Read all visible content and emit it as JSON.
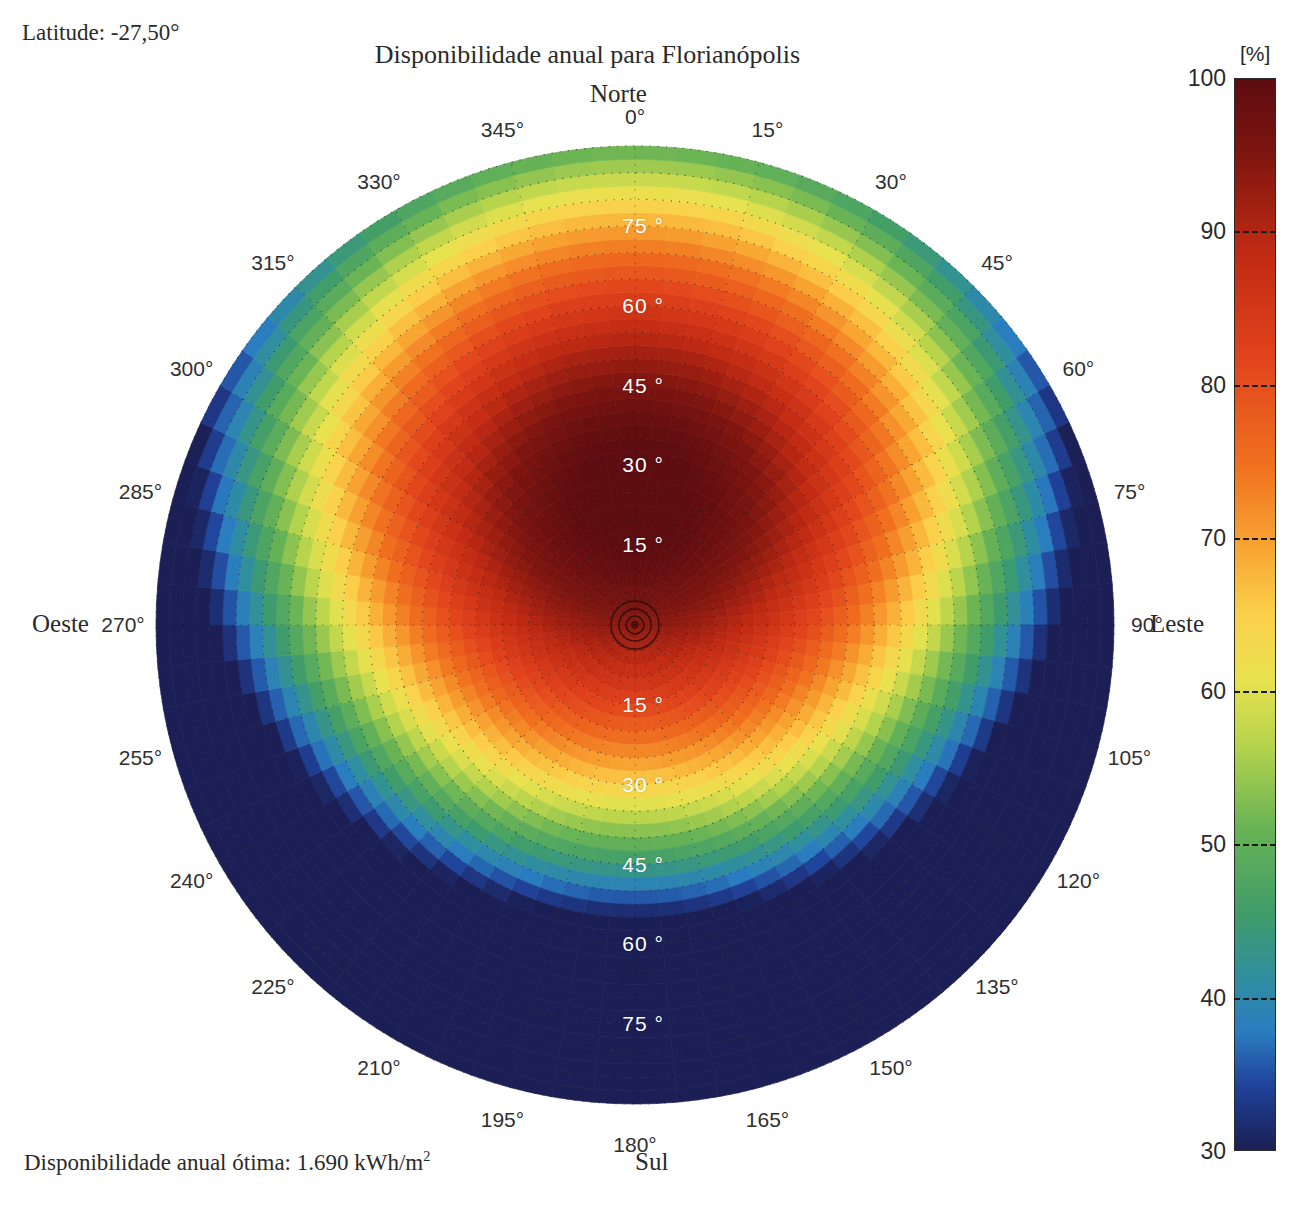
{
  "header": {
    "latitude_label": "Latitude: -27,50°",
    "title": "Disponibilidade anual para Florianópolis"
  },
  "footer": {
    "optimum_label": "Disponibilidade anual ótima: 1.690 kWh/m",
    "optimum_unit_exponent": "2"
  },
  "cardinals": {
    "north": "Norte",
    "south": "Sul",
    "east": "Leste",
    "west": "Oeste"
  },
  "colorbar": {
    "unit": "[%]",
    "ticks": [
      "100",
      "90",
      "80",
      "70",
      "60",
      "50",
      "40",
      "30"
    ],
    "tick_values": [
      100,
      90,
      80,
      70,
      60,
      50,
      40,
      30
    ],
    "min": 30,
    "max": 100,
    "stops": [
      {
        "pos": 0.0,
        "color": "#5d0c10"
      },
      {
        "pos": 0.07,
        "color": "#7e1510"
      },
      {
        "pos": 0.16,
        "color": "#c02a13"
      },
      {
        "pos": 0.26,
        "color": "#e1431c"
      },
      {
        "pos": 0.36,
        "color": "#f0701f"
      },
      {
        "pos": 0.44,
        "color": "#f8a733"
      },
      {
        "pos": 0.5,
        "color": "#fbd04a"
      },
      {
        "pos": 0.56,
        "color": "#e9e24f"
      },
      {
        "pos": 0.62,
        "color": "#b7d44c"
      },
      {
        "pos": 0.7,
        "color": "#68b355"
      },
      {
        "pos": 0.78,
        "color": "#3f9c6a"
      },
      {
        "pos": 0.84,
        "color": "#2f8ea0"
      },
      {
        "pos": 0.89,
        "color": "#2a7cc0"
      },
      {
        "pos": 0.94,
        "color": "#20429a"
      },
      {
        "pos": 1.0,
        "color": "#1b1f55"
      }
    ]
  },
  "chart_data": {
    "type": "heatmap",
    "projection": "polar",
    "title": "Disponibilidade anual para Florianópolis",
    "subtitle": "Latitude: -27,50°",
    "unit": "%",
    "value_min": 30,
    "value_max": 100,
    "radial_axis": {
      "name": "Inclinação",
      "unit": "°",
      "min": 0,
      "max": 90,
      "tick_labels": [
        "15 °",
        "30 °",
        "45 °",
        "60 °",
        "75 °"
      ],
      "tick_values": [
        15,
        30,
        45,
        60,
        75
      ]
    },
    "angular_axis": {
      "name": "Azimute",
      "unit": "°",
      "zero_at": "Norte",
      "direction": "clockwise",
      "tick_step": 15,
      "tick_labels": [
        "0°",
        "15°",
        "30°",
        "45°",
        "60°",
        "75°",
        "90°",
        "105°",
        "120°",
        "135°",
        "150°",
        "165°",
        "180°",
        "195°",
        "210°",
        "225°",
        "240°",
        "255°",
        "270°",
        "285°",
        "300°",
        "315°",
        "330°",
        "345°"
      ],
      "tick_values": [
        0,
        15,
        30,
        45,
        60,
        75,
        90,
        105,
        120,
        135,
        150,
        165,
        180,
        195,
        210,
        225,
        240,
        255,
        270,
        285,
        300,
        315,
        330,
        345
      ]
    },
    "optimum": {
      "label": "Disponibilidade anual ótima",
      "value": 1690,
      "value_text": "1.690",
      "unit": "kWh/m²",
      "azimuth_deg": 0,
      "tilt_deg": 27
    },
    "grid": true,
    "legend_position": "right",
    "samples": [
      {
        "azimuth": 0,
        "tilt": 0,
        "value": 92
      },
      {
        "azimuth": 0,
        "tilt": 15,
        "value": 98
      },
      {
        "azimuth": 0,
        "tilt": 27,
        "value": 100
      },
      {
        "azimuth": 0,
        "tilt": 45,
        "value": 96
      },
      {
        "azimuth": 0,
        "tilt": 60,
        "value": 88
      },
      {
        "azimuth": 0,
        "tilt": 75,
        "value": 76
      },
      {
        "azimuth": 0,
        "tilt": 90,
        "value": 63
      },
      {
        "azimuth": 45,
        "tilt": 30,
        "value": 93
      },
      {
        "azimuth": 45,
        "tilt": 60,
        "value": 78
      },
      {
        "azimuth": 45,
        "tilt": 90,
        "value": 55
      },
      {
        "azimuth": 90,
        "tilt": 15,
        "value": 91
      },
      {
        "azimuth": 90,
        "tilt": 30,
        "value": 84
      },
      {
        "azimuth": 90,
        "tilt": 45,
        "value": 74
      },
      {
        "azimuth": 90,
        "tilt": 60,
        "value": 64
      },
      {
        "azimuth": 90,
        "tilt": 90,
        "value": 48
      },
      {
        "azimuth": 135,
        "tilt": 30,
        "value": 74
      },
      {
        "azimuth": 135,
        "tilt": 60,
        "value": 50
      },
      {
        "azimuth": 135,
        "tilt": 90,
        "value": 35
      },
      {
        "azimuth": 180,
        "tilt": 15,
        "value": 84
      },
      {
        "azimuth": 180,
        "tilt": 30,
        "value": 70
      },
      {
        "azimuth": 180,
        "tilt": 45,
        "value": 55
      },
      {
        "azimuth": 180,
        "tilt": 60,
        "value": 44
      },
      {
        "azimuth": 180,
        "tilt": 75,
        "value": 36
      },
      {
        "azimuth": 180,
        "tilt": 90,
        "value": 31
      },
      {
        "azimuth": 225,
        "tilt": 30,
        "value": 74
      },
      {
        "azimuth": 225,
        "tilt": 60,
        "value": 50
      },
      {
        "azimuth": 225,
        "tilt": 90,
        "value": 35
      },
      {
        "azimuth": 270,
        "tilt": 15,
        "value": 91
      },
      {
        "azimuth": 270,
        "tilt": 30,
        "value": 84
      },
      {
        "azimuth": 270,
        "tilt": 45,
        "value": 74
      },
      {
        "azimuth": 270,
        "tilt": 60,
        "value": 64
      },
      {
        "azimuth": 270,
        "tilt": 90,
        "value": 48
      },
      {
        "azimuth": 315,
        "tilt": 30,
        "value": 93
      },
      {
        "azimuth": 315,
        "tilt": 60,
        "value": 78
      },
      {
        "azimuth": 315,
        "tilt": 90,
        "value": 55
      }
    ]
  },
  "geometry": {
    "center_x": 635,
    "center_y": 625,
    "radius": 479,
    "azimuth_label_radius": 512,
    "tilt_label_azimuths": [
      0,
      180
    ]
  }
}
